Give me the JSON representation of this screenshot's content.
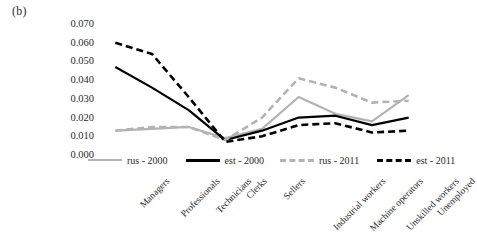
{
  "panel_label": "(b)",
  "chart_data": {
    "type": "line",
    "title": "",
    "xlabel": "",
    "ylabel": "Modified Index of Isolation",
    "ylim": [
      0.0,
      0.07
    ],
    "ytick_labels": [
      "0.070",
      "0.060",
      "0.050",
      "0.040",
      "0.030",
      "0.020",
      "0.010",
      "0.000"
    ],
    "ytick_values": [
      0.07,
      0.06,
      0.05,
      0.04,
      0.03,
      0.02,
      0.01,
      0.0
    ],
    "grid": false,
    "legend_position": "bottom",
    "categories": [
      "Managers",
      "Professionals",
      "Technicians",
      "Clerks",
      "Sellers",
      "Industrial workers",
      "Machine operators",
      "Unskilled workers",
      "Unemployed"
    ],
    "series": [
      {
        "name": "rus - 2000",
        "color": "#b3b3b3",
        "style": "solid",
        "values": [
          0.013,
          0.014,
          0.015,
          0.009,
          0.014,
          0.031,
          0.022,
          0.018,
          0.032
        ]
      },
      {
        "name": "est - 2000",
        "color": "#000000",
        "style": "solid",
        "values": [
          0.047,
          0.036,
          0.024,
          0.008,
          0.013,
          0.02,
          0.021,
          0.016,
          0.02
        ]
      },
      {
        "name": "rus - 2011",
        "color": "#b3b3b3",
        "style": "dashed",
        "values": [
          0.013,
          0.015,
          0.015,
          0.008,
          0.02,
          0.041,
          0.036,
          0.028,
          0.029
        ]
      },
      {
        "name": "est - 2011",
        "color": "#000000",
        "style": "dashed",
        "values": [
          0.06,
          0.054,
          0.031,
          0.007,
          0.01,
          0.016,
          0.017,
          0.012,
          0.013
        ]
      }
    ]
  }
}
